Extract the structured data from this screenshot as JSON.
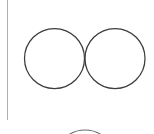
{
  "canvas": {
    "width": 154,
    "height": 134,
    "background_color": "#ffffff",
    "title": "Two tangent circles with left vertical rule"
  },
  "colors": {
    "circle_stroke": "#3c3c3c",
    "rule_stroke": "#b0b0b0",
    "partial_arc_stroke": "#6e6e6e",
    "background": "#ffffff"
  },
  "shapes": {
    "vertical_rule": {
      "label": "vertical rule",
      "x": 7.5,
      "y_start": 0,
      "y_end": 120,
      "stroke_width": 1.3,
      "color": "#b0b0b0"
    },
    "circles": [
      {
        "label": "left circle",
        "cx": 54.5,
        "cy": 58.5,
        "r": 30,
        "stroke_width": 1.25,
        "color": "#3c3c3c",
        "fill": "none"
      },
      {
        "label": "right circle",
        "cx": 115,
        "cy": 58.5,
        "r": 30,
        "stroke_width": 1.25,
        "color": "#3c3c3c",
        "fill": "none"
      }
    ],
    "partial_arc": {
      "label": "cropped circle top edge",
      "cx": 85,
      "cy": 160,
      "r": 30,
      "stroke_width": 1.1,
      "color": "#6e6e6e",
      "fill": "none"
    }
  }
}
